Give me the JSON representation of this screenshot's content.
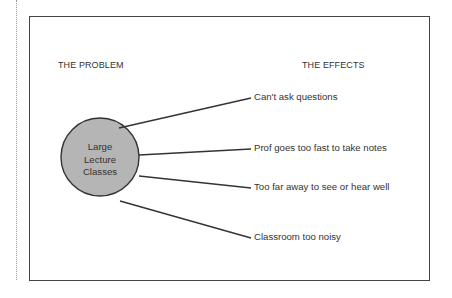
{
  "diagram": {
    "problem_heading": "THE PROBLEM",
    "effects_heading": "THE EFFECTS",
    "problem": {
      "lines": [
        "Large",
        "Lecture",
        "Classes"
      ],
      "fill_color": "#b5b5b5",
      "stroke_color": "#333333"
    },
    "effects": [
      {
        "label": "Can't ask questions"
      },
      {
        "label": "Prof goes too fast to take notes"
      },
      {
        "label": "Too far away to see or hear well"
      },
      {
        "label": "Classroom too noisy"
      }
    ]
  }
}
